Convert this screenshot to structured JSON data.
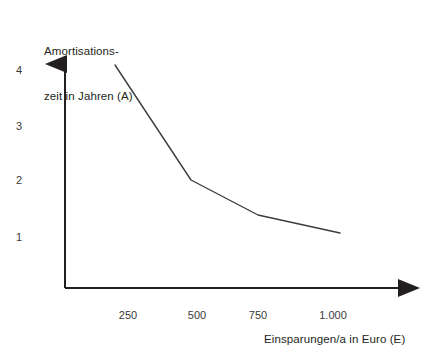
{
  "chart_data": {
    "type": "line",
    "title": "",
    "subtitle": "",
    "xlabel": "Einsparungen/a in Euro (E)",
    "ylabel": "Amortisations-\nzeit in Jahren (A)",
    "ylabel_line1": "Amortisations-",
    "ylabel_line2": "zeit in Jahren (A)",
    "x": [
      250,
      500,
      750,
      1000
    ],
    "xtick_labels": [
      "250",
      "500",
      "750",
      "1.000"
    ],
    "ytick_labels": [
      "1",
      "2",
      "3",
      "4"
    ],
    "ytick_values": [
      1,
      2,
      3,
      4
    ],
    "series": [
      {
        "name": "Amortisationszeit",
        "values": [
          4.1,
          2.0,
          1.4,
          1.08
        ],
        "color": "#3c3c3c"
      }
    ],
    "xlim": [
      140,
      1150
    ],
    "ylim": [
      0,
      4.35
    ],
    "grid": false,
    "legend": false,
    "legend_position": "none",
    "axis_style": "arrow",
    "axis_color": "#231f20",
    "line_color": "#3c3c3c",
    "background_color": "#ffffff"
  },
  "geometry": {
    "origin_x": 65,
    "origin_y": 288,
    "y_axis_tip_y": 57,
    "x_axis_tip_x": 427,
    "y_unit_px": 55.5,
    "x_tick_px": [
      128,
      197,
      258,
      333
    ],
    "y_tick_px": [
      237,
      180,
      126,
      70
    ],
    "point_px": [
      [
        115,
        65
      ],
      [
        191,
        180
      ],
      [
        258,
        215
      ],
      [
        340,
        233
      ]
    ]
  }
}
